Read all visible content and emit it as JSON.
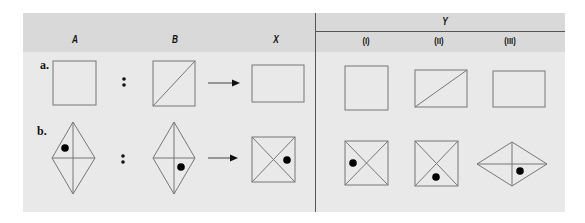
{
  "header": {
    "columns": [
      "A",
      "B",
      "X"
    ],
    "group_label": "Y",
    "subcolumns": [
      "(I)",
      "(II)",
      "(III)"
    ]
  },
  "rows": [
    {
      "label": "a.",
      "A": "square",
      "B": "square with diagonal (bottom-left to top-right)",
      "X": "wide rectangle",
      "Y": [
        "square",
        "wide rectangle with diagonal (bottom-left to top-right)",
        "wide rectangle"
      ]
    },
    {
      "label": "b.",
      "A": "tall diamond with cross, dot upper-left",
      "B": "tall diamond with cross, dot lower-right",
      "X": "square with X diagonals, dot right",
      "Y": [
        "square with X diagonals, dot left",
        "square with X diagonals, dot bottom",
        "wide diamond with cross, dot lower-right"
      ]
    }
  ],
  "symbols": {
    "ratio": ":",
    "arrow": "→"
  },
  "colors": {
    "panel": "#e9e9e9",
    "header": "#d9d9d9",
    "stroke": "#777777",
    "divider": "#555555",
    "dot": "#000000"
  }
}
